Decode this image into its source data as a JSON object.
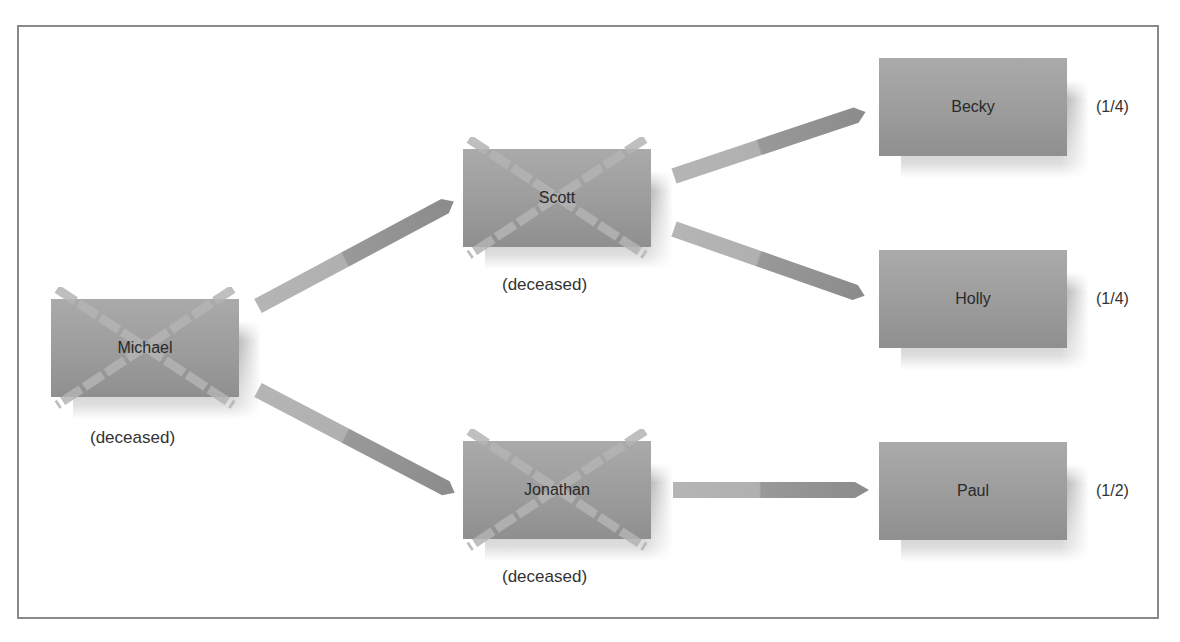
{
  "diagram": {
    "type": "inheritance-tree",
    "nodes": [
      {
        "id": "michael",
        "name": "Michael",
        "status": "(deceased)",
        "deceased": true
      },
      {
        "id": "scott",
        "name": "Scott",
        "status": "(deceased)",
        "deceased": true
      },
      {
        "id": "jonathan",
        "name": "Jonathan",
        "status": "(deceased)",
        "deceased": true
      },
      {
        "id": "becky",
        "name": "Becky",
        "share": "(1/4)",
        "deceased": false
      },
      {
        "id": "holly",
        "name": "Holly",
        "share": "(1/4)",
        "deceased": false
      },
      {
        "id": "paul",
        "name": "Paul",
        "share": "(1/2)",
        "deceased": false
      }
    ],
    "edges": [
      {
        "from": "michael",
        "to": "scott"
      },
      {
        "from": "michael",
        "to": "jonathan"
      },
      {
        "from": "scott",
        "to": "becky"
      },
      {
        "from": "scott",
        "to": "holly"
      },
      {
        "from": "jonathan",
        "to": "paul"
      }
    ],
    "colors": {
      "box": "#9c9c9c",
      "arrow_light": "#b3b3b3",
      "arrow_dark": "#8e8e8e",
      "cross": "#b0b0b0",
      "frame": "#8a8a8a"
    }
  }
}
